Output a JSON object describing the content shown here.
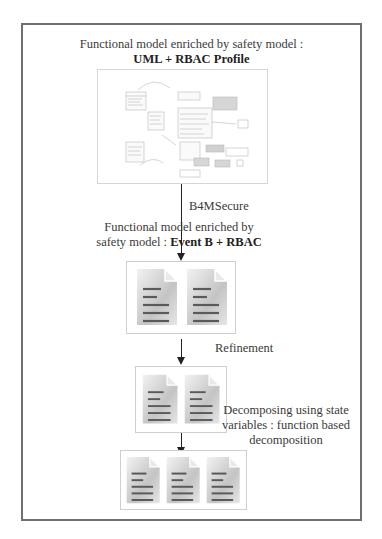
{
  "diagram": {
    "top_cut_text": "",
    "stage1": {
      "title_line1": "Functional model enriched by safety model :",
      "title_line2": "UML +  RBAC Profile",
      "image": "uml-class-diagram-thumbnail"
    },
    "transition1": {
      "label": "B4MSecure"
    },
    "stage2": {
      "title_line1": "Functional model enriched by",
      "title_line2_prefix": "safety model : ",
      "title_line2_bold": "Event B + RBAC",
      "documents": 2
    },
    "transition2": {
      "label": "Refinement"
    },
    "stage3": {
      "documents": 2
    },
    "transition3": {
      "label_line1": "Decomposing using state",
      "label_line2": "variables : function based",
      "label_line3": "decomposition"
    },
    "stage4": {
      "documents": 3
    },
    "colors": {
      "frame": "#6f6f6f",
      "arrow": "#222222",
      "doc_page": "#bdbdbd",
      "doc_lines": "#5a5a5a",
      "box_border": "#cfcfcf"
    },
    "icons": [
      "document-icon",
      "arrow-down-icon",
      "uml-diagram-image"
    ]
  }
}
